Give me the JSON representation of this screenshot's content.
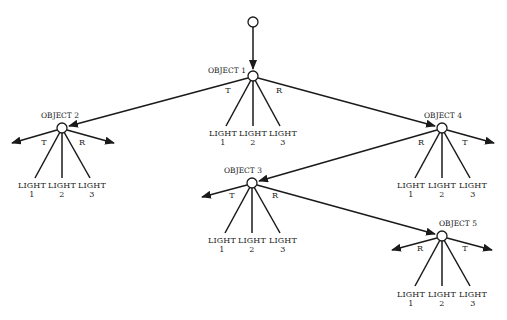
{
  "diagram": {
    "type": "ray-tracing-tree",
    "colors": {
      "stroke": "#1a1a1a",
      "node_fill": "#ffffff",
      "background": "#ffffff"
    },
    "root": {
      "x": 253,
      "y": 22
    },
    "objects": [
      {
        "id": "obj1",
        "label": "OBJECT 1",
        "x": 253,
        "y": 76,
        "branches": {
          "T": "obj2",
          "R": "obj4"
        },
        "lights": [
          {
            "label": "LIGHT",
            "num": "1"
          },
          {
            "label": "LIGHT",
            "num": "2"
          },
          {
            "label": "LIGHT",
            "num": "3"
          }
        ]
      },
      {
        "id": "obj2",
        "label": "OBJECT 2",
        "x": 62,
        "y": 128,
        "branches": {
          "T": "arrow-left",
          "R": "arrow-right"
        },
        "lights": [
          {
            "label": "LIGHT",
            "num": "1"
          },
          {
            "label": "LIGHT",
            "num": "2"
          },
          {
            "label": "LIGHT",
            "num": "3"
          }
        ]
      },
      {
        "id": "obj4",
        "label": "OBJECT 4",
        "x": 442,
        "y": 128,
        "branches": {
          "R": "obj3",
          "T": "arrow-right"
        },
        "lights": [
          {
            "label": "LIGHT",
            "num": "1"
          },
          {
            "label": "LIGHT",
            "num": "2"
          },
          {
            "label": "LIGHT",
            "num": "3"
          }
        ]
      },
      {
        "id": "obj3",
        "label": "OBJECT 3",
        "x": 252,
        "y": 183,
        "branches": {
          "T": "arrow-left",
          "R": "obj5"
        },
        "lights": [
          {
            "label": "LIGHT",
            "num": "1"
          },
          {
            "label": "LIGHT",
            "num": "2"
          },
          {
            "label": "LIGHT",
            "num": "3"
          }
        ]
      },
      {
        "id": "obj5",
        "label": "OBJECT 5",
        "x": 442,
        "y": 236,
        "branches": {
          "R": "arrow-left",
          "T": "arrow-right"
        },
        "lights": [
          {
            "label": "LIGHT",
            "num": "1"
          },
          {
            "label": "LIGHT",
            "num": "2"
          },
          {
            "label": "LIGHT",
            "num": "3"
          }
        ]
      }
    ],
    "branch_labels": {
      "transmitted": "T",
      "reflected": "R"
    }
  }
}
